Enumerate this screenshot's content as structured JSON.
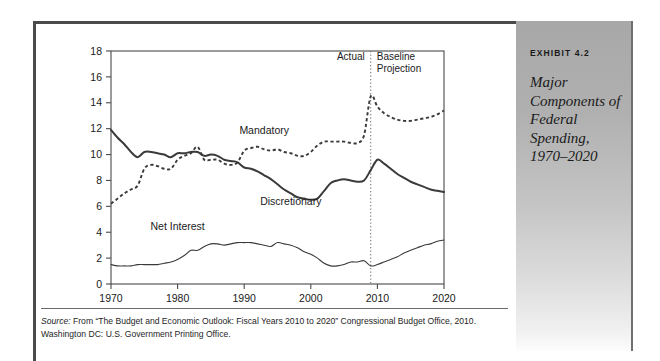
{
  "figure": {
    "exhibit_label": "EXHIBIT 4.2",
    "exhibit_title": "Major Components of Federal Spending, 1970–2020",
    "source_lead": "Source:",
    "source_text": " From “The Budget and Economic Outlook: Fiscal Years 2010 to 2020” Congressional Budget Office, 2010. Washington DC: U.S. Government Printing Office."
  },
  "colors": {
    "frame": "#4a4a4a",
    "sidebar_top": "#a8a8a8",
    "sidebar_bottom": "#fdfdfd",
    "line": "#3a3a3a",
    "axis": "#4a4a4a",
    "text": "#1a1a1a"
  },
  "annotations": {
    "actual": "Actual",
    "baseline_projection": "Baseline\nProjection",
    "baseline_projection_line1": "Baseline",
    "baseline_projection_line2": "Projection",
    "divider_year": 2009
  },
  "chart_data": {
    "type": "line",
    "title": "Major Components of Federal Spending, 1970–2020",
    "xlabel": "",
    "ylabel": "",
    "xlim": [
      1970,
      2020
    ],
    "ylim": [
      0,
      18
    ],
    "ytick_step": 2,
    "yticks": [
      0,
      2,
      4,
      6,
      8,
      10,
      12,
      14,
      16,
      18
    ],
    "xticks": [
      1970,
      1980,
      1990,
      2000,
      2010,
      2020
    ],
    "xtick_labels": [
      "1970",
      "1980",
      "1990",
      "2000",
      "2010",
      "2020"
    ],
    "grid": false,
    "legend": "inline-labels",
    "units": "percent of GDP",
    "x": [
      1970,
      1971,
      1972,
      1973,
      1974,
      1975,
      1976,
      1977,
      1978,
      1979,
      1980,
      1981,
      1982,
      1983,
      1984,
      1985,
      1986,
      1987,
      1988,
      1989,
      1990,
      1991,
      1992,
      1993,
      1994,
      1995,
      1996,
      1997,
      1998,
      1999,
      2000,
      2001,
      2002,
      2003,
      2004,
      2005,
      2006,
      2007,
      2008,
      2009,
      2010,
      2011,
      2012,
      2013,
      2014,
      2015,
      2016,
      2017,
      2018,
      2019,
      2020
    ],
    "series": [
      {
        "name": "Mandatory",
        "label": "Mandatory",
        "style": "dotted",
        "label_x": 1993,
        "label_y": 11.6,
        "values": [
          6.2,
          6.6,
          7.0,
          7.3,
          7.6,
          8.9,
          9.2,
          9.1,
          8.9,
          8.9,
          9.6,
          9.9,
          10.1,
          10.6,
          9.6,
          9.6,
          9.6,
          9.3,
          9.2,
          9.4,
          10.3,
          10.5,
          10.6,
          10.4,
          10.3,
          10.4,
          10.2,
          10.1,
          9.9,
          9.9,
          10.2,
          10.7,
          11.0,
          11.0,
          11.0,
          11.0,
          10.9,
          10.9,
          11.5,
          14.5,
          13.7,
          13.2,
          12.9,
          12.7,
          12.6,
          12.6,
          12.7,
          12.8,
          12.9,
          13.1,
          13.4
        ]
      },
      {
        "name": "Discretionary",
        "label": "Discretionary",
        "style": "solid-bold",
        "label_x": 1997,
        "label_y": 6.1,
        "values": [
          11.9,
          11.3,
          10.8,
          10.2,
          9.8,
          10.2,
          10.2,
          10.1,
          10.0,
          9.8,
          10.1,
          10.1,
          10.2,
          10.2,
          9.9,
          10.0,
          9.9,
          9.6,
          9.5,
          9.4,
          9.0,
          8.9,
          8.7,
          8.4,
          8.1,
          7.7,
          7.3,
          7.0,
          6.7,
          6.6,
          6.5,
          6.6,
          7.2,
          7.8,
          8.0,
          8.1,
          8.0,
          7.9,
          8.0,
          8.8,
          9.6,
          9.3,
          8.9,
          8.5,
          8.2,
          7.9,
          7.7,
          7.5,
          7.3,
          7.2,
          7.1
        ]
      },
      {
        "name": "Net Interest",
        "label": "Net Interest",
        "style": "solid-thin",
        "label_x": 1980,
        "label_y": 4.2,
        "values": [
          1.5,
          1.4,
          1.4,
          1.4,
          1.5,
          1.5,
          1.5,
          1.5,
          1.6,
          1.7,
          1.9,
          2.2,
          2.6,
          2.6,
          2.9,
          3.1,
          3.1,
          3.0,
          3.1,
          3.2,
          3.2,
          3.2,
          3.1,
          3.0,
          2.9,
          3.2,
          3.1,
          3.0,
          2.8,
          2.5,
          2.3,
          2.0,
          1.6,
          1.4,
          1.4,
          1.5,
          1.7,
          1.7,
          1.8,
          1.4,
          1.5,
          1.7,
          1.9,
          2.1,
          2.4,
          2.6,
          2.8,
          3.0,
          3.1,
          3.3,
          3.4
        ]
      }
    ]
  }
}
